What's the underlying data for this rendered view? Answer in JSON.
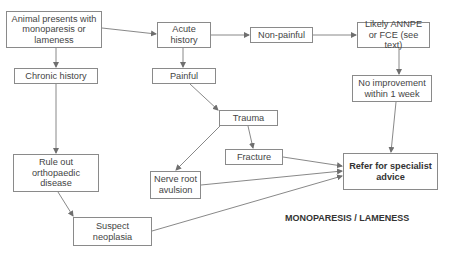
{
  "diagram": {
    "title": "MONOPARESIS / LAMENESS",
    "nodes": {
      "start": "Animal presents with monoparesis or lameness",
      "chronic": "Chronic history",
      "acute": "Acute history",
      "nonpainful": "Non-painful",
      "annpe": "Likely ANNPE or FCE (see text)",
      "painful": "Painful",
      "noimprove": "No improvement within 1 week",
      "trauma": "Trauma",
      "fracture": "Fracture",
      "avulsion": "Nerve root avulsion",
      "ortho": "Rule out orthopaedic disease",
      "neoplasia": "Suspect neoplasia",
      "refer": "Refer for specialist advice"
    },
    "edges": [
      [
        "start",
        "chronic"
      ],
      [
        "start",
        "acute"
      ],
      [
        "acute",
        "nonpainful"
      ],
      [
        "nonpainful",
        "annpe"
      ],
      [
        "acute",
        "painful"
      ],
      [
        "annpe",
        "noimprove"
      ],
      [
        "noimprove",
        "refer"
      ],
      [
        "painful",
        "trauma"
      ],
      [
        "trauma",
        "fracture"
      ],
      [
        "trauma",
        "avulsion"
      ],
      [
        "fracture",
        "refer"
      ],
      [
        "avulsion",
        "refer"
      ],
      [
        "chronic",
        "ortho"
      ],
      [
        "ortho",
        "neoplasia"
      ],
      [
        "neoplasia",
        "refer"
      ]
    ],
    "colors": {
      "line": "#6f6f6f",
      "border": "#8a8a8a",
      "text": "#444444"
    }
  }
}
